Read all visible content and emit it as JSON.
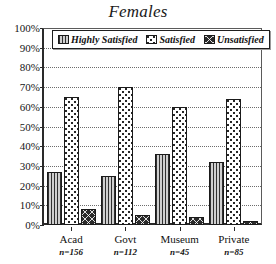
{
  "chart_data": {
    "type": "bar",
    "title": "Females",
    "xlabel": "",
    "ylabel": "",
    "ylim": [
      0,
      100
    ],
    "grid": true,
    "legend_position": "top-inside-left",
    "categories": [
      "Acad",
      "Govt",
      "Museum",
      "Private"
    ],
    "category_notes": [
      "n=156",
      "n=112",
      "n=45",
      "n=85"
    ],
    "ytick_labels": [
      "100%",
      "90%",
      "80%",
      "70%",
      "60%",
      "50%",
      "40%",
      "30%",
      "20%",
      "10%",
      "0%"
    ],
    "ytick_values": [
      100,
      90,
      80,
      70,
      60,
      50,
      40,
      30,
      20,
      10,
      0
    ],
    "series": [
      {
        "name": "Highly Satisfied",
        "pattern": "vertical-lines",
        "color": "#b9b9b9",
        "values": [
          27,
          25,
          36,
          32
        ]
      },
      {
        "name": "Satisfied",
        "pattern": "dots",
        "color": "#ffffff",
        "values": [
          65,
          70,
          60,
          64
        ]
      },
      {
        "name": "Unsatisfied",
        "pattern": "cross-hatch",
        "color": "#2b2b2b",
        "values": [
          8,
          5,
          4,
          2
        ]
      }
    ]
  },
  "legend": {
    "items": [
      {
        "label": "Highly Satisfied",
        "swatch": "vertical-lines-swatch"
      },
      {
        "label": "Satisfied",
        "swatch": "dots-swatch"
      },
      {
        "label": "Unsatisfied",
        "swatch": "cross-hatch-swatch"
      }
    ]
  }
}
